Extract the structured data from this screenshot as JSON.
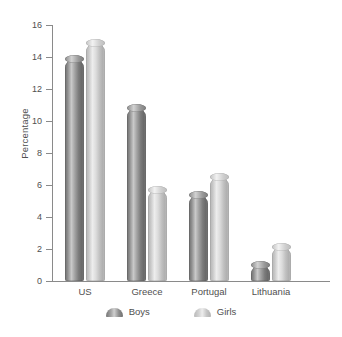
{
  "chart_data": {
    "type": "bar",
    "title": "",
    "subtitle": "",
    "xlabel": "",
    "ylabel": "Percentage",
    "categories": [
      "US",
      "Greece",
      "Portugal",
      "Lithuania"
    ],
    "series": [
      {
        "name": "Boys",
        "values": [
          13.9,
          10.8,
          5.4,
          1.0
        ],
        "color": "#8a8a8a"
      },
      {
        "name": "Girls",
        "values": [
          14.9,
          5.7,
          6.5,
          2.1
        ],
        "color": "#cfcfcf"
      }
    ],
    "ylim": [
      0,
      16
    ],
    "ytick_labels": [
      "16",
      "14",
      "12",
      "10",
      "8",
      "6",
      "4",
      "2",
      "0"
    ],
    "ytick_values": [
      16,
      14,
      12,
      10,
      8,
      6,
      4,
      2,
      0
    ],
    "ystep": 2,
    "grid": false,
    "legend_position": "bottom",
    "legend_entries": [
      "Boys",
      "Girls"
    ],
    "bar_style": "cylinder",
    "background_color": "#ffffff",
    "axis_color": "#8a8a8a",
    "text_color": "#4f4f4f"
  }
}
